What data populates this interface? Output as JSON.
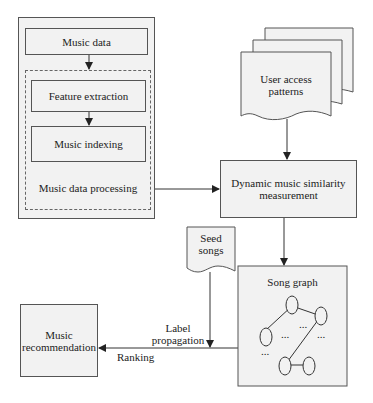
{
  "diagram": {
    "music_data_panel": {
      "music_data": "Music data",
      "feature_extraction": "Feature extraction",
      "music_indexing": "Music indexing",
      "processing_label": "Music data processing"
    },
    "user_access_patterns": {
      "line1": "User access",
      "line2": "patterns"
    },
    "dynamic_similarity": {
      "line1": "Dynamic music similarity",
      "line2": "measurement"
    },
    "seed_songs": {
      "line1": "Seed",
      "line2": "songs"
    },
    "song_graph": {
      "title": "Song graph",
      "ellipsis": "..."
    },
    "music_recommendation": {
      "line1": "Music",
      "line2": "recommendation"
    },
    "edge_labels": {
      "label_propagation_1": "Label",
      "label_propagation_2": "propagation",
      "ranking": "Ranking"
    },
    "colors": {
      "box_fill": "#f2f2f2",
      "stroke": "#333333"
    }
  }
}
